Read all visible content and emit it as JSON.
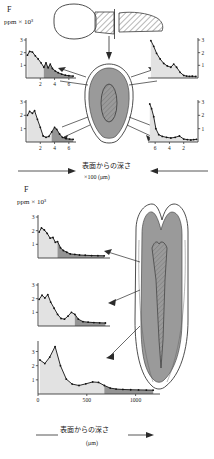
{
  "figure": {
    "element_symbol": "F",
    "y_axis_label": "ppm × 10³",
    "upper_panel": {
      "axis_caption": "表面からの深さ",
      "axis_unit": "×100 (μm)",
      "arrow_left": "→",
      "arrow_right": "←",
      "y_ticks": [
        "1",
        "2",
        "3"
      ],
      "charts": [
        {
          "id": "upper-left",
          "position": "top-left",
          "x_ticks": [
            "2",
            "4",
            "6"
          ],
          "x_reversed": false,
          "ylim": [
            0,
            3
          ],
          "xlim": [
            0,
            7
          ],
          "x": [
            0.2,
            0.5,
            0.9,
            1.3,
            1.7,
            2.1,
            2.5,
            2.8,
            3.1,
            3.4,
            3.7,
            4.1,
            4.5,
            5.0,
            5.5,
            6.0,
            6.6
          ],
          "y": [
            1.8,
            2.1,
            2.05,
            1.75,
            1.5,
            1.2,
            0.85,
            1.2,
            0.8,
            1.1,
            0.75,
            0.55,
            0.42,
            0.3,
            0.22,
            0.18,
            0.15
          ],
          "shade_from": 2.5
        },
        {
          "id": "upper-right",
          "position": "top-right",
          "x_ticks": [],
          "x_reversed": true,
          "ylim": [
            0,
            3
          ],
          "xlim": [
            0,
            7
          ],
          "x": [
            0.3,
            0.8,
            1.2,
            1.6,
            2.0,
            2.5,
            3.0,
            3.4,
            3.8,
            4.3,
            4.8,
            5.3,
            5.8,
            6.2,
            6.6
          ],
          "y": [
            0.12,
            0.14,
            0.13,
            0.15,
            0.2,
            0.45,
            0.85,
            1.1,
            0.85,
            0.95,
            1.15,
            1.5,
            1.95,
            2.5,
            2.95
          ],
          "shade_from": 0.0
        },
        {
          "id": "lower-left",
          "position": "bottom-left",
          "x_ticks": [
            "2",
            "4",
            "6"
          ],
          "x_reversed": false,
          "ylim": [
            0,
            3
          ],
          "xlim": [
            0,
            7
          ],
          "x": [
            0.2,
            0.5,
            0.9,
            1.2,
            1.6,
            2.0,
            2.4,
            2.8,
            3.2,
            3.6,
            4.0,
            4.3,
            4.7,
            5.1,
            5.6,
            6.1,
            6.6
          ],
          "y": [
            2.0,
            2.3,
            2.15,
            2.35,
            1.7,
            1.1,
            0.45,
            0.35,
            0.42,
            0.75,
            1.1,
            0.95,
            0.6,
            0.35,
            0.25,
            0.22,
            0.2
          ],
          "shade_from": 3.4
        },
        {
          "id": "lower-right",
          "position": "bottom-right",
          "x_ticks": [
            "6",
            "4",
            "2"
          ],
          "x_reversed": true,
          "ylim": [
            0,
            3
          ],
          "xlim": [
            0,
            7
          ],
          "x": [
            0.2,
            0.6,
            1.0,
            1.5,
            2.0,
            2.6,
            3.2,
            3.8,
            4.4,
            5.0,
            5.5,
            5.9,
            6.2,
            6.5,
            6.75
          ],
          "y": [
            0.2,
            0.18,
            0.15,
            0.18,
            0.22,
            0.45,
            0.35,
            0.3,
            0.35,
            0.42,
            0.55,
            1.0,
            1.9,
            2.5,
            2.85
          ],
          "shade_from": 0.0
        }
      ],
      "diagram": {
        "tooth_profile": "tooth-side-profile-with-hatched-root",
        "cross_section": "tooth-cross-section-oval-with-hatched-pulp"
      }
    },
    "lower_panel": {
      "axis_caption": "表面からの深さ",
      "axis_unit": "(μm)",
      "x_ticks": [
        "0",
        "500",
        "1000"
      ],
      "y_ticks": [
        "1",
        "2",
        "3"
      ],
      "charts": [
        {
          "id": "lower-panel-top",
          "position": "top",
          "ylim": [
            0,
            3
          ],
          "xlim": [
            0,
            1250
          ],
          "x": [
            20,
            60,
            110,
            160,
            210,
            260,
            300,
            340,
            390,
            440,
            500,
            560,
            640,
            720,
            820,
            930,
            1040,
            1150
          ],
          "y": [
            1.9,
            2.2,
            2.05,
            1.8,
            1.45,
            1.5,
            1.15,
            1.2,
            0.75,
            0.55,
            0.42,
            0.3,
            0.26,
            0.22,
            0.2,
            0.18,
            0.17,
            0.16
          ],
          "shade_from": 340
        },
        {
          "id": "lower-panel-middle",
          "position": "middle",
          "ylim": [
            0,
            3
          ],
          "xlim": [
            0,
            1250
          ],
          "x": [
            20,
            70,
            120,
            170,
            220,
            280,
            340,
            400,
            460,
            520,
            580,
            640,
            700,
            780,
            870,
            970,
            1070,
            1170
          ],
          "y": [
            1.95,
            2.25,
            2.05,
            2.3,
            1.75,
            1.3,
            0.85,
            0.55,
            0.5,
            0.72,
            1.0,
            0.85,
            0.5,
            0.32,
            0.28,
            0.25,
            0.23,
            0.22
          ],
          "shade_from": 640
        },
        {
          "id": "lower-panel-bottom",
          "position": "bottom",
          "ylim": [
            0,
            3.6
          ],
          "xlim": [
            0,
            1250
          ],
          "x": [
            20,
            70,
            120,
            175,
            230,
            290,
            350,
            420,
            490,
            560,
            620,
            680,
            740,
            800,
            870,
            950,
            1030,
            1110,
            1180
          ],
          "y": [
            2.4,
            2.15,
            2.6,
            3.35,
            2.0,
            1.05,
            0.7,
            0.6,
            0.72,
            0.85,
            0.82,
            0.6,
            0.42,
            0.35,
            0.32,
            0.3,
            0.29,
            0.28,
            0.27
          ],
          "shade_from": 680
        }
      ],
      "diagram": {
        "tooth_longitudinal": "tooth-longitudinal-section-enamel-dentin-pulp"
      }
    },
    "colors": {
      "ink": "#1a1a1a",
      "axis": "#3a3a3a",
      "curve": "#111111",
      "shade_light": "#e2e2e2",
      "shade_dark": "#8c8c8c",
      "dentin_gray": "#9a9a9a",
      "enamel_white": "#ffffff",
      "hatch": "#777777"
    }
  }
}
